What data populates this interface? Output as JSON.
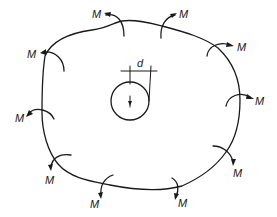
{
  "diagram": {
    "moment_label": "M",
    "dimension_label": "d",
    "colors": {
      "stroke": "#1a1a1a",
      "background": "#ffffff"
    },
    "moments": [
      {
        "id": "top-left",
        "label": "M"
      },
      {
        "id": "top-right",
        "label": "M"
      },
      {
        "id": "upper-right",
        "label": "M"
      },
      {
        "id": "right",
        "label": "M"
      },
      {
        "id": "lower-right",
        "label": "M"
      },
      {
        "id": "bottom-right",
        "label": "M"
      },
      {
        "id": "bottom-mid",
        "label": "M"
      },
      {
        "id": "lower-left",
        "label": "M"
      },
      {
        "id": "left",
        "label": "M"
      },
      {
        "id": "upper-left",
        "label": "M"
      }
    ]
  }
}
